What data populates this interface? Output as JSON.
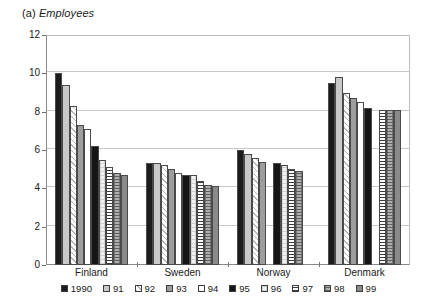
{
  "title": {
    "prefix": "(a) ",
    "main": "Employees"
  },
  "chart_data": {
    "type": "bar",
    "title": "(a) Employees",
    "xlabel": "",
    "ylabel": "",
    "ylim": [
      0,
      12
    ],
    "yticks": [
      0,
      2,
      4,
      6,
      8,
      10,
      12
    ],
    "grid": true,
    "legend_position": "bottom",
    "categories": [
      "Finland",
      "Sweden",
      "Norway",
      "Denmark"
    ],
    "series": [
      {
        "name": "1990",
        "values": [
          10.0,
          5.3,
          6.0,
          9.5
        ]
      },
      {
        "name": "91",
        "values": [
          9.4,
          5.3,
          5.8,
          9.8
        ]
      },
      {
        "name": "92",
        "values": [
          8.3,
          5.2,
          5.6,
          9.0
        ]
      },
      {
        "name": "93",
        "values": [
          7.3,
          5.0,
          5.4,
          8.7
        ]
      },
      {
        "name": "94",
        "values": [
          7.1,
          4.8,
          null,
          8.5
        ]
      },
      {
        "name": "95",
        "values": [
          6.2,
          4.7,
          5.3,
          8.2
        ]
      },
      {
        "name": "96",
        "values": [
          5.5,
          4.7,
          5.2,
          null
        ]
      },
      {
        "name": "97",
        "values": [
          5.1,
          4.4,
          5.0,
          8.1
        ]
      },
      {
        "name": "98",
        "values": [
          4.8,
          4.2,
          4.9,
          8.1
        ]
      },
      {
        "name": "99",
        "values": [
          4.7,
          4.1,
          null,
          8.1
        ]
      }
    ]
  },
  "legend": [
    {
      "label": "1990",
      "swatch": "fill-solid-black"
    },
    {
      "label": "91",
      "swatch": "fill-light-gray"
    },
    {
      "label": "92",
      "swatch": "fill-diag-hatch"
    },
    {
      "label": "93",
      "swatch": "fill-mid-gray"
    },
    {
      "label": "94",
      "swatch": "fill-white"
    },
    {
      "label": "95",
      "swatch": "fill-solid-black2"
    },
    {
      "label": "96",
      "swatch": "fill-faint-cross"
    },
    {
      "label": "97",
      "swatch": "fill-horiz-lines"
    },
    {
      "label": "98",
      "swatch": "fill-gray-cross"
    },
    {
      "label": "99",
      "swatch": "fill-dark-gray"
    }
  ],
  "colors": {
    "axis": "#8a8a8a",
    "grid": "#c8c8c8",
    "text": "#1a1a1a",
    "background": "#ffffff"
  }
}
